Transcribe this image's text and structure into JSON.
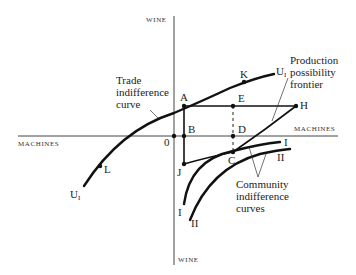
{
  "axes": {
    "vertical_top_label": "WINE",
    "vertical_bottom_label": "WINE",
    "horizontal_left_label": "MACHINES",
    "horizontal_right_label": "MACHINES",
    "origin_label": "0"
  },
  "points": {
    "A": "A",
    "B": "B",
    "C": "C",
    "D": "D",
    "E": "E",
    "H": "H",
    "J": "J",
    "K": "K",
    "L": "L"
  },
  "curves": {
    "trade_upper_label": "U",
    "trade_upper_sub": "I",
    "trade_lower_label": "U",
    "trade_lower_sub": "I",
    "community_I_right": "I",
    "community_I_left": "I",
    "community_II_right": "II",
    "community_II_left": "II"
  },
  "annotations": {
    "trade_indifference": [
      "Trade",
      "indifference",
      "curve"
    ],
    "production_frontier": [
      "Production",
      "possibility",
      "frontier"
    ],
    "community_indifference": [
      "Community",
      "indifference",
      "curves"
    ]
  }
}
